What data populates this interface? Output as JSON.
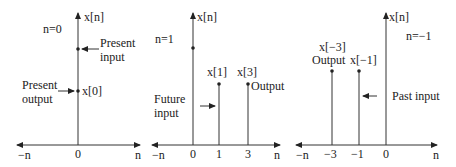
{
  "figure": {
    "panels": [
      {
        "id": "present",
        "condition": "n=0",
        "y_axis_label": "x[n]",
        "x_axis_left": "−n",
        "x_axis_right": "n",
        "ticks": [
          "0"
        ],
        "annotations": {
          "present_input": [
            "Present",
            "input"
          ],
          "present_output": [
            "Present",
            "output"
          ],
          "output_sample": "x[0]"
        }
      },
      {
        "id": "future",
        "condition": "n=1",
        "y_axis_label": "x[n]",
        "x_axis_left": "−n",
        "x_axis_right": "n",
        "ticks": [
          "0",
          "1",
          "3"
        ],
        "annotations": {
          "sample_1": "x[1]",
          "sample_3": "x[3]",
          "output": "Output",
          "future_input": [
            "Future",
            "input"
          ]
        }
      },
      {
        "id": "past",
        "condition": "n=−1",
        "y_axis_label": "x[n]",
        "x_axis_left": "−n",
        "x_axis_right": "n",
        "ticks": [
          "−3",
          "−1",
          "0"
        ],
        "annotations": {
          "sample_m3": "x[−3]",
          "output": "Output",
          "sample_m1": "x[−1]",
          "past_input": "Past input"
        }
      }
    ]
  }
}
